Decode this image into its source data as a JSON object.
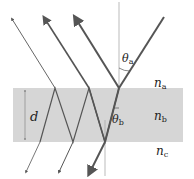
{
  "diagram": {
    "labels": {
      "theta_a": {
        "symbol": "θ",
        "sub": "a"
      },
      "theta_b": {
        "symbol": "θ",
        "sub": "b"
      },
      "n_a": {
        "symbol": "n",
        "sub": "a"
      },
      "n_b": {
        "symbol": "n",
        "sub": "b"
      },
      "n_c": {
        "symbol": "n",
        "sub": "c"
      },
      "thickness": "d"
    },
    "colors": {
      "slab": "#d6d6d6",
      "ray": "#555555",
      "normal": "#aaaaaa"
    }
  }
}
